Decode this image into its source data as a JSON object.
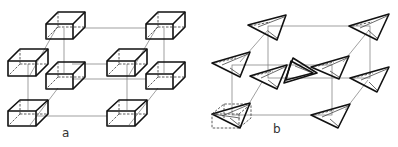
{
  "figure": {
    "panels": [
      {
        "id": "a",
        "label": "a",
        "description": "Lattice of rectangular box units arranged at corners and face positions of a unit cell"
      },
      {
        "id": "b",
        "label": "b",
        "description": "Lattice of tetrahedral/triangular units arranged at corresponding positions of a unit cell, one shown inside a dashed box"
      }
    ]
  },
  "colors": {
    "line": "#111111",
    "grid": "#777777",
    "background": "#ffffff"
  }
}
